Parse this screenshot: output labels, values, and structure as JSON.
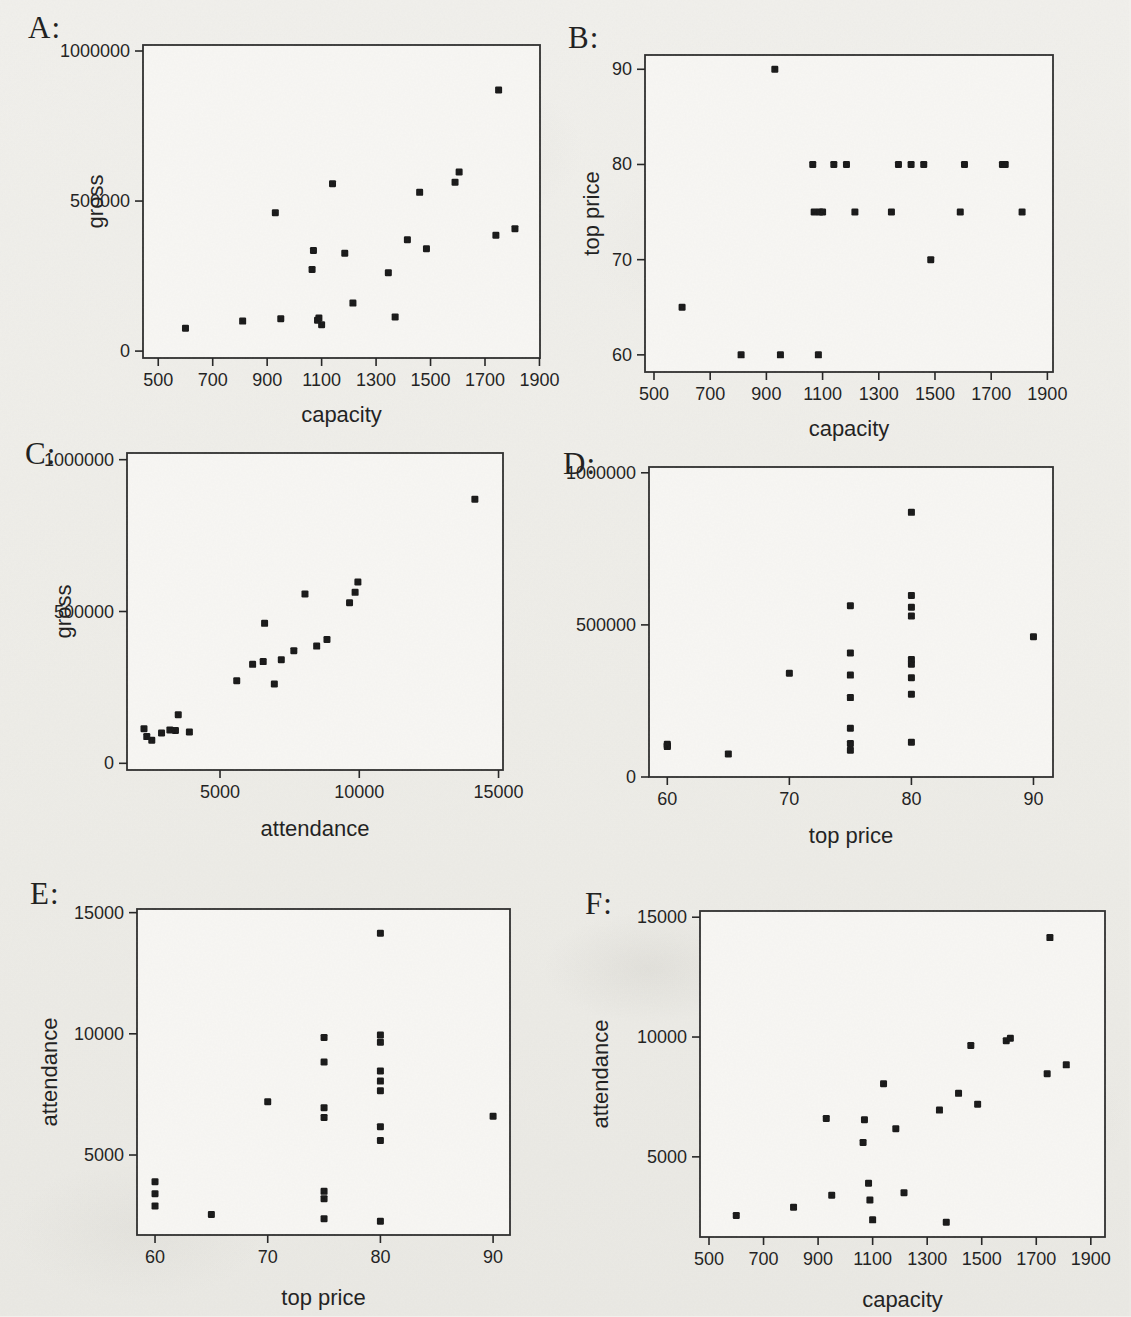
{
  "style": {
    "page_background": "#f0efeb",
    "plot_background": "#f8f7f4",
    "frame_color": "#2b2b2b",
    "tick_color": "#222222",
    "marker_color": "#151515",
    "text_color": "#1c1c1c"
  },
  "chart_data": {
    "type": "scatter",
    "description_variables": [
      "capacity",
      "top price",
      "attendance",
      "gross"
    ],
    "records": {
      "columns": [
        "capacity",
        "top price",
        "attendance",
        "gross"
      ],
      "rows": [
        [
          600,
          65,
          2550,
          76000
        ],
        [
          810,
          60,
          2900,
          100000
        ],
        [
          930,
          90,
          6600,
          461000
        ],
        [
          950,
          60,
          3400,
          108000
        ],
        [
          1065,
          80,
          5600,
          272000
        ],
        [
          1070,
          75,
          6550,
          335000
        ],
        [
          1085,
          60,
          3900,
          103000
        ],
        [
          1090,
          75,
          3200,
          110000
        ],
        [
          1100,
          75,
          2370,
          88000
        ],
        [
          1140,
          80,
          8050,
          558000
        ],
        [
          1185,
          80,
          6170,
          326000
        ],
        [
          1215,
          75,
          3500,
          160000
        ],
        [
          1345,
          75,
          6950,
          261000
        ],
        [
          1370,
          80,
          2270,
          114000
        ],
        [
          1415,
          80,
          7650,
          371000
        ],
        [
          1460,
          80,
          9650,
          529000
        ],
        [
          1485,
          70,
          7200,
          341000
        ],
        [
          1590,
          75,
          9850,
          563000
        ],
        [
          1605,
          80,
          9950,
          597000
        ],
        [
          1740,
          80,
          8470,
          386000
        ],
        [
          1750,
          80,
          14150,
          870000
        ],
        [
          1810,
          75,
          8840,
          408000
        ]
      ]
    },
    "charts": [
      {
        "panel_label": "A:",
        "x_var": "capacity",
        "y_var": "gross",
        "xlabel": "capacity",
        "ylabel": "gross",
        "xticks": [
          500,
          700,
          900,
          1100,
          1300,
          1500,
          1700,
          1900
        ],
        "xtick_labels": [
          "500",
          "700",
          "900",
          "1100",
          "1300",
          "1500",
          "1700",
          "1900"
        ],
        "yticks": [
          0,
          500000,
          1000000
        ],
        "ytick_labels": [
          "0",
          "500000",
          "1000000"
        ],
        "x_range": [
          444,
          1902
        ],
        "y_range": [
          -23000,
          1020000
        ],
        "grid": false,
        "legend": null
      },
      {
        "panel_label": "B:",
        "x_var": "capacity",
        "y_var": "top price",
        "xlabel": "capacity",
        "ylabel": "top price",
        "xticks": [
          500,
          700,
          900,
          1100,
          1300,
          1500,
          1700,
          1900
        ],
        "xtick_labels": [
          "500",
          "700",
          "900",
          "1100",
          "1300",
          "1500",
          "1700",
          "1900"
        ],
        "yticks": [
          60,
          70,
          80,
          90
        ],
        "ytick_labels": [
          "60",
          "70",
          "80",
          "90"
        ],
        "x_range": [
          468,
          1920
        ],
        "y_range": [
          58.2,
          91.5
        ],
        "grid": false,
        "legend": null
      },
      {
        "panel_label": "C:",
        "x_var": "attendance",
        "y_var": "gross",
        "xlabel": "attendance",
        "ylabel": "gross",
        "xticks": [
          5000,
          10000,
          15000
        ],
        "xtick_labels": [
          "5000",
          "10000",
          "15000"
        ],
        "yticks": [
          0,
          500000,
          1000000
        ],
        "ytick_labels": [
          "0",
          "500000",
          "1000000"
        ],
        "x_range": [
          1660,
          15160
        ],
        "y_range": [
          -22000,
          1022000
        ],
        "grid": false,
        "legend": null
      },
      {
        "panel_label": "D:",
        "x_var": "top price",
        "y_var": "gross",
        "xlabel": "top price",
        "ylabel": null,
        "xticks": [
          60,
          70,
          80,
          90
        ],
        "xtick_labels": [
          "60",
          "70",
          "80",
          "90"
        ],
        "yticks": [
          0,
          500000,
          1000000
        ],
        "ytick_labels": [
          "0",
          "500000",
          "1000000"
        ],
        "x_range": [
          58.5,
          91.6
        ],
        "y_range": [
          0,
          1019000
        ],
        "grid": false,
        "legend": null
      },
      {
        "panel_label": "E:",
        "x_var": "top price",
        "y_var": "attendance",
        "xlabel": "top price",
        "ylabel": "attendance",
        "xticks": [
          60,
          70,
          80,
          90
        ],
        "xtick_labels": [
          "60",
          "70",
          "80",
          "90"
        ],
        "yticks": [
          5000,
          10000,
          15000
        ],
        "ytick_labels": [
          "5000",
          "10000",
          "15000"
        ],
        "x_range": [
          58.4,
          91.5
        ],
        "y_range": [
          1700,
          15150
        ],
        "grid": false,
        "legend": null
      },
      {
        "panel_label": "F:",
        "x_var": "capacity",
        "y_var": "attendance",
        "xlabel": "capacity",
        "ylabel": "attendance",
        "xticks": [
          500,
          700,
          900,
          1100,
          1300,
          1500,
          1700,
          1900
        ],
        "xtick_labels": [
          "500",
          "700",
          "900",
          "1100",
          "1300",
          "1500",
          "1700",
          "1900"
        ],
        "yticks": [
          5000,
          10000,
          15000
        ],
        "ytick_labels": [
          "5000",
          "10000",
          "15000"
        ],
        "x_range": [
          467,
          1952
        ],
        "y_range": [
          1655,
          15260
        ],
        "grid": false,
        "legend": null
      }
    ]
  }
}
